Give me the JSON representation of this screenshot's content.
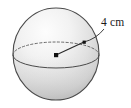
{
  "figure": {
    "kind": "sphere-radius-diagram",
    "background_color": "#ffffff",
    "sphere": {
      "name": "sphere",
      "center_x": 56,
      "center_y": 54,
      "radius_x": 43,
      "radius_y": 46,
      "outline_color": "#4a4a4a",
      "fill_light": "#fbfbfb",
      "fill_mid": "#e2e2e2",
      "fill_dark": "#b9b9b9"
    },
    "equator": {
      "name": "equator-ellipse",
      "center_x": 56,
      "center_y": 55,
      "radius_x": 43,
      "radius_y": 13,
      "back_style": "dashed",
      "front_style": "solid",
      "stroke_color": "#555555"
    },
    "center_point": {
      "name": "center-dot",
      "x": 56,
      "y": 55,
      "size": 4,
      "color": "#111111"
    },
    "surface_point": {
      "name": "radius-endpoint-dot",
      "x": 84,
      "y": 42,
      "size": 3,
      "color": "#111111"
    },
    "radius_line": {
      "name": "radius-line",
      "x1": 56,
      "y1": 55,
      "x2": 84,
      "y2": 42,
      "stroke_color": "#2b2b2b"
    },
    "leader_line": {
      "name": "leader-line",
      "from_x": 84,
      "from_y": 42,
      "to_x": 104,
      "to_y": 29,
      "stroke_color": "#2b2b2b"
    },
    "dimension_label": {
      "name": "radius-label",
      "text": "4 cm",
      "value": 4,
      "unit": "cm",
      "x": 101,
      "y": 26,
      "color": "#1a1a1a"
    }
  }
}
